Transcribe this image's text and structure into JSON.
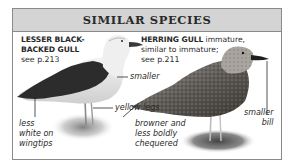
{
  "panel": {
    "title": "SIMILAR SPECIES",
    "colors": {
      "header_bg": "#d4d4d4",
      "border": "#8a8a8a",
      "text": "#2a2a2a"
    }
  },
  "left_species": {
    "name_line1": "LESSER BLACK-",
    "name_line2": "BACKED GULL",
    "ref": "see p.213",
    "annotations": {
      "smaller": "smaller",
      "yellow_legs": "yellow legs",
      "wingtips_line1": "less",
      "wingtips_line2": "white on",
      "wingtips_line3": "wingtips"
    }
  },
  "right_species": {
    "name": "HERRING GULL",
    "desc_line1": " immature,",
    "desc_line2": "similar to immature;",
    "ref": "see p.211",
    "annotations": {
      "plumage_line1": "browner and",
      "plumage_line2": "less boldly",
      "plumage_line3": "chequered",
      "bill_line1": "smaller",
      "bill_line2": "bill"
    }
  }
}
